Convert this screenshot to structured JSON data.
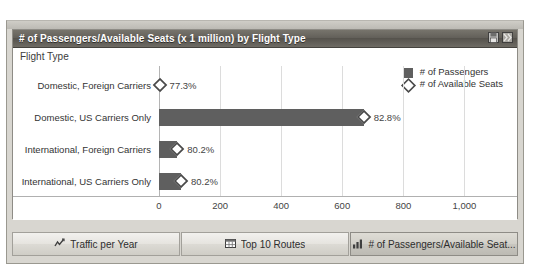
{
  "panel": {
    "title": "# of Passengers/Available Seats (x 1 million) by Flight Type",
    "header_icons": [
      {
        "name": "save-icon"
      },
      {
        "name": "export-icon"
      }
    ]
  },
  "chart_data": {
    "type": "bar",
    "orientation": "horizontal",
    "title": "# of Passengers/Available Seats (x 1 million) by Flight Type",
    "axis_caption": "Flight Type",
    "xlabel": "",
    "ylabel": "Flight Type",
    "xlim": [
      0,
      1100
    ],
    "grid": true,
    "legend_position": "top-right",
    "categories": [
      "Domestic, Foreign Carriers",
      "Domestic, US Carriers Only",
      "International, Foreign Carriers",
      "International, US Carriers Only"
    ],
    "series": [
      {
        "name": "# of Passengers",
        "marker": "square",
        "color": "#5f5f5f",
        "values": [
          2,
          670,
          60,
          72
        ]
      },
      {
        "name": "# of Available Seats",
        "marker": "diamond",
        "color": "#4a4a4a",
        "values": [
          2,
          810,
          80,
          95
        ]
      }
    ],
    "point_labels": [
      "77.3%",
      "82.8%",
      "80.2%",
      "80.2%"
    ],
    "xticks": [
      {
        "value": 0,
        "label": "0"
      },
      {
        "value": 200,
        "label": "200"
      },
      {
        "value": 400,
        "label": "400"
      },
      {
        "value": 600,
        "label": "600"
      },
      {
        "value": 800,
        "label": "800"
      },
      {
        "value": 1000,
        "label": "1,000"
      }
    ],
    "legend": [
      {
        "label": "# of Passengers",
        "marker": "square"
      },
      {
        "label": "# of Available Seats",
        "marker": "diamond"
      }
    ]
  },
  "tabs": [
    {
      "label": "Traffic per Year",
      "icon": "line-chart-icon",
      "active": false
    },
    {
      "label": "Top 10 Routes",
      "icon": "table-icon",
      "active": false
    },
    {
      "label": "# of Passengers/Available Seat...",
      "icon": "bar-chart-icon",
      "active": true
    }
  ]
}
